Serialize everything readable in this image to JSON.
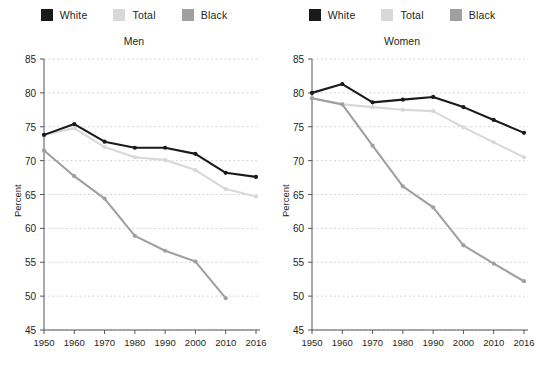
{
  "chart_data": [
    {
      "type": "line",
      "title": "Men",
      "xlabel": "",
      "ylabel": "Percent",
      "ylim": [
        45,
        85
      ],
      "yticks": [
        45,
        50,
        55,
        60,
        65,
        70,
        75,
        80,
        85
      ],
      "grid": true,
      "legend_position": "top-center",
      "x": [
        1950,
        1960,
        1970,
        1980,
        1990,
        2000,
        2010,
        2016
      ],
      "xticklabels": [
        "1950",
        "1960",
        "1970",
        "1980",
        "1990",
        "2000",
        "2010",
        "2016"
      ],
      "series": [
        {
          "name": "White",
          "color": "#1a1a1a",
          "values": [
            73.8,
            75.4,
            72.8,
            71.9,
            71.9,
            71.0,
            68.2,
            67.6
          ]
        },
        {
          "name": "Total",
          "color": "#d8d8d8",
          "values": [
            73.8,
            74.8,
            72.0,
            70.5,
            70.1,
            68.6,
            65.8,
            64.7
          ]
        },
        {
          "name": "Black",
          "color": "#a0a0a0",
          "values": [
            71.5,
            67.7,
            64.4,
            58.9,
            56.7,
            55.1,
            49.7,
            null
          ]
        }
      ]
    },
    {
      "type": "line",
      "title": "Women",
      "xlabel": "",
      "ylabel": "Percent",
      "ylim": [
        45,
        85
      ],
      "yticks": [
        45,
        50,
        55,
        60,
        65,
        70,
        75,
        80,
        85
      ],
      "grid": true,
      "legend_position": "top-center",
      "x": [
        1950,
        1960,
        1970,
        1980,
        1990,
        2000,
        2010,
        2016
      ],
      "xticklabels": [
        "1950",
        "1960",
        "1970",
        "1980",
        "1990",
        "2000",
        "2010",
        "2016"
      ],
      "series": [
        {
          "name": "White",
          "color": "#1a1a1a",
          "values": [
            80.0,
            81.3,
            78.6,
            79.0,
            79.4,
            77.9,
            76.0,
            74.1
          ]
        },
        {
          "name": "Total",
          "color": "#d8d8d8",
          "values": [
            79.2,
            78.3,
            77.9,
            77.5,
            77.3,
            74.9,
            72.7,
            70.5
          ]
        },
        {
          "name": "Black",
          "color": "#a0a0a0",
          "values": [
            79.2,
            78.3,
            72.2,
            66.2,
            63.1,
            57.5,
            54.8,
            52.2
          ]
        }
      ]
    }
  ],
  "panels": [
    {
      "title": "Men",
      "ylabel": "Percent",
      "legend": [
        {
          "label": "White",
          "color": "#1a1a1a"
        },
        {
          "label": "Total",
          "color": "#d8d8d8"
        },
        {
          "label": "Black",
          "color": "#a0a0a0"
        }
      ]
    },
    {
      "title": "Women",
      "ylabel": "Percent",
      "legend": [
        {
          "label": "White",
          "color": "#1a1a1a"
        },
        {
          "label": "Total",
          "color": "#d8d8d8"
        },
        {
          "label": "Black",
          "color": "#a0a0a0"
        }
      ]
    }
  ]
}
